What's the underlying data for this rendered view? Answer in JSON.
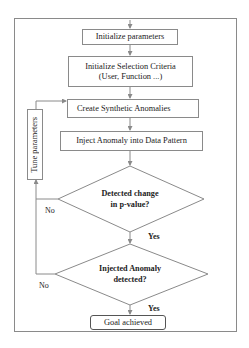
{
  "diagram": {
    "type": "flowchart",
    "nodes": {
      "init_params": "Initialize parameters",
      "selection_line1": "Initialize Selection Criteria",
      "selection_line2": "(User, Function ...)",
      "create_anomalies": "Create Synthetic Anomalies",
      "inject_anomaly": "Inject Anomaly into Data Pattern",
      "decision1_line1": "Detected change",
      "decision1_line2": "in p-value?",
      "decision2_line1": "Injected Anomaly",
      "decision2_line2": "detected?",
      "goal": "Goal achieved",
      "tune_params": "Tune parameters"
    },
    "edge_labels": {
      "decision1_no": "No",
      "decision1_yes": "Yes",
      "decision2_no": "No",
      "decision2_yes": "Yes"
    },
    "colors": {
      "line": "#8a8a8a",
      "text": "#222222",
      "background": "#ffffff"
    }
  }
}
